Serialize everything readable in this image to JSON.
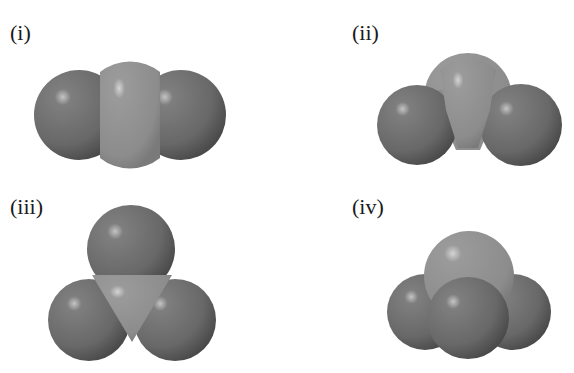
{
  "figure": {
    "panels": [
      {
        "id": "i",
        "label": "(i)",
        "shape": "linear",
        "atoms": 3
      },
      {
        "id": "ii",
        "label": "(ii)",
        "shape": "bent",
        "atoms": 3
      },
      {
        "id": "iii",
        "label": "(iii)",
        "shape": "trigonal planar",
        "atoms": 4
      },
      {
        "id": "iv",
        "label": "(iv)",
        "shape": "trigonal pyramidal",
        "atoms": 4
      }
    ],
    "colors": {
      "central_atom": "#8f8f8f",
      "outer_atom": "#6e6e6e",
      "background": "#ffffff"
    }
  }
}
